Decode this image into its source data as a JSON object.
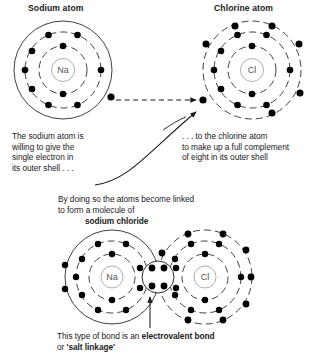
{
  "diagram": {
    "labels": {
      "sodium_atom_title": "Sodium atom",
      "chlorine_atom_title": "Chlorine atom",
      "na_nucleus": "Na",
      "cl_nucleus": "Cl",
      "molecule_na_nucleus": "Na",
      "molecule_cl_nucleus": "Cl"
    },
    "annotations": {
      "left_note": [
        "The sodium atom is",
        "willing to give the",
        "single electron in",
        "its outer shell . . ."
      ],
      "right_note": [
        ". . . to the chlorine atom",
        "to make up a full complement",
        "of eight in its outer shell"
      ],
      "middle_note": [
        "By doing so the atoms become linked",
        "to form a molecule of"
      ],
      "molecule_name": "sodium chloride",
      "bottom_note_prefix": "This type of bond is an ",
      "bottom_note_bold": "electrovalent bond",
      "bottom_note_line2_prefix": "or ",
      "bottom_note_line2_bold": "'salt linkage'"
    },
    "atoms": {
      "sodium": {
        "symbol": "Na",
        "shells": [
          2,
          8,
          1
        ]
      },
      "chlorine": {
        "symbol": "Cl",
        "shells": [
          2,
          8,
          7
        ]
      },
      "molecule_sodium": {
        "symbol": "Na",
        "shells": [
          2,
          8,
          0
        ]
      },
      "molecule_chlorine": {
        "symbol": "Cl",
        "shells": [
          2,
          8,
          8
        ]
      },
      "shared_pair_count": 2
    },
    "colors": {
      "ink": "#1a1a1a",
      "shell_line": "#2b2b2b",
      "electron": "#111111",
      "nucleus_text": "#555555",
      "background": "#ffffff"
    }
  }
}
